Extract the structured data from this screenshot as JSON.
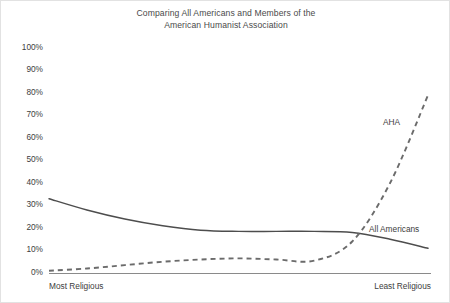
{
  "chart": {
    "title_line1": "Comparing All Americans and Members of the",
    "title_line2": "American Humanist Association"
  },
  "axis": {
    "x_left_label": "Most Religious",
    "x_right_label": "Least Religious",
    "y_ticks": [
      "100%",
      "90%",
      "80%",
      "70%",
      "60%",
      "50%",
      "40%",
      "30%",
      "20%",
      "10%",
      "0%"
    ]
  },
  "annotations": {
    "aha": "AHA",
    "all_americans": "All Americans"
  },
  "colors": {
    "line": "#4d4d4d",
    "axis": "#8a8a8a",
    "text": "#3d3d3d",
    "title": "#4a4a4a",
    "background": "#ffffff"
  },
  "chart_data": {
    "type": "line",
    "title": "Comparing All Americans and Members of the American Humanist Association",
    "xlabel": "",
    "ylabel": "",
    "xlim": [
      0,
      10
    ],
    "ylim": [
      0,
      100
    ],
    "grid": false,
    "legend_position": "inline-annotation",
    "x_axis_endpoints": [
      "Most Religious",
      "Least Religious"
    ],
    "y_tick_values": [
      0,
      10,
      20,
      30,
      40,
      50,
      60,
      70,
      80,
      90,
      100
    ],
    "y_tick_labels": [
      "0%",
      "10%",
      "20%",
      "30%",
      "40%",
      "50%",
      "60%",
      "70%",
      "80%",
      "90%",
      "100%"
    ],
    "x": [
      0,
      1,
      2,
      3,
      4,
      5,
      6,
      7,
      8,
      9,
      10
    ],
    "series": [
      {
        "name": "All Americans",
        "style": "solid",
        "values": [
          33,
          28,
          24,
          21,
          19,
          18.5,
          18.5,
          18.5,
          18,
          15,
          11
        ]
      },
      {
        "name": "AHA",
        "style": "dashed",
        "values": [
          1,
          2,
          3.5,
          5,
          6,
          6.5,
          6,
          5.5,
          14,
          40,
          79
        ]
      }
    ]
  }
}
